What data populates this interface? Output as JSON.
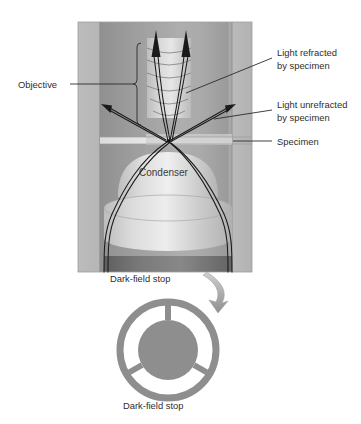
{
  "figure": {
    "background_color": "#ffffff"
  },
  "labels": {
    "objective": "Objective",
    "light_refracted_line1": "Light refracted",
    "light_refracted_line2": "by specimen",
    "light_unrefracted_line1": "Light unrefracted",
    "light_unrefracted_line2": "by specimen",
    "specimen": "Specimen",
    "condenser": "Condenser",
    "darkfield_stop_upper": "Dark-field stop",
    "darkfield_stop_caption": "Dark-field stop"
  },
  "colors": {
    "body_outer": "#b4b4b4",
    "body_inner_dark": "#8f8f8f",
    "body_inner_light": "#c9c9c9",
    "lens_light": "#d7d7d7",
    "lens_highlight": "#eaeaea",
    "stop_bar_dark": "#6f6f6f",
    "stop_disc": "#8e8e8e",
    "ray_stroke": "#1a1a1a",
    "text": "#2e2e2e",
    "leader": "#2b2b2b",
    "arrow_swoosh": "#9a9a9a"
  },
  "geometry": {
    "body_left": 78,
    "body_right": 252,
    "body_top": 22,
    "body_bottom": 272,
    "specimen_y": 141,
    "stop_center_x": 168,
    "stop_center_y": 350,
    "stop_outer_radius": 48,
    "stop_inner_radius": 30
  },
  "icons": {
    "arrowhead": "arrowhead-icon",
    "swoosh_arrow": "curved-arrow-icon",
    "bracket": "bracket-icon"
  }
}
